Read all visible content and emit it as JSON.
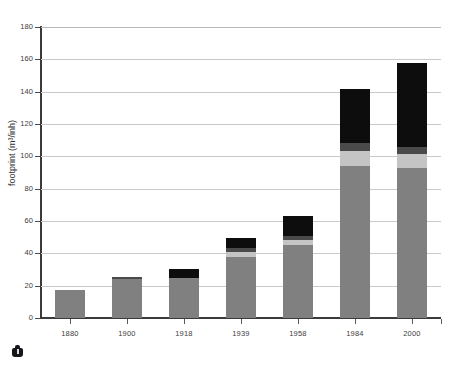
{
  "figure": {
    "background_color": "#ffffff",
    "plot_background_color": "#ffffff",
    "grid_color": "#c9c9c9",
    "axis_color": "#3a3a3a",
    "corner_logo_name": "publisher-logo"
  },
  "chart_data": {
    "type": "bar",
    "stacked": true,
    "title": "",
    "subtitle": "",
    "xlabel": "",
    "ylabel": "footprint (m³/inh)",
    "ylabel_plain": "footprint (m3/inh)",
    "categories": [
      "1880",
      "1900",
      "1918",
      "1939",
      "1958",
      "1984",
      "2000"
    ],
    "ylim": [
      0,
      180
    ],
    "yticks": [
      0,
      20,
      40,
      60,
      80,
      100,
      120,
      140,
      160,
      180
    ],
    "ytick_labels": [
      "0",
      "20",
      "40",
      "60",
      "80",
      "100",
      "120",
      "140",
      "160",
      "180"
    ],
    "grid": true,
    "grid_axis": "y",
    "legend": "none",
    "legend_position": "none",
    "annotations": [],
    "series": [
      {
        "name": "segment-1-base-gray",
        "color": "#808080",
        "values": [
          17.5,
          24.0,
          25.0,
          38.0,
          45.0,
          94.0,
          93.0
        ]
      },
      {
        "name": "segment-2-light-gray",
        "color": "#c4c4c4",
        "values": [
          0,
          0,
          0,
          3.0,
          3.5,
          9.5,
          8.5
        ]
      },
      {
        "name": "segment-3-dark-gray",
        "color": "#4a4a4a",
        "values": [
          0,
          1.5,
          0,
          2.0,
          2.0,
          4.5,
          4.5
        ]
      },
      {
        "name": "segment-4-black",
        "color": "#0d0d0d",
        "values": [
          0,
          0,
          5.5,
          6.5,
          12.5,
          33.5,
          51.5
        ]
      }
    ],
    "totals": [
      17.5,
      25.5,
      30.5,
      49.5,
      63.0,
      141.5,
      157.5
    ]
  }
}
